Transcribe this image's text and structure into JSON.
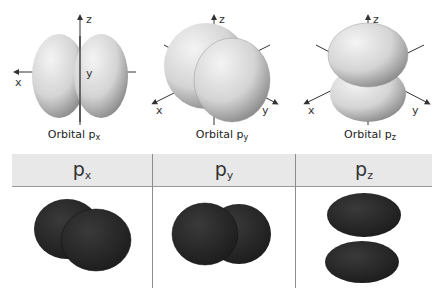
{
  "orbitals": [
    {
      "name": "Orbital p",
      "sub": "x",
      "axes": {
        "z": "z",
        "x": "x",
        "y": "y"
      }
    },
    {
      "name": "Orbital p",
      "sub": "y",
      "axes": {
        "z": "z",
        "x": "x",
        "y": "y"
      }
    },
    {
      "name": "Orbital p",
      "sub": "z",
      "axes": {
        "z": "z",
        "x": "x",
        "y": "y"
      }
    }
  ],
  "table": {
    "headers": [
      {
        "main": "p",
        "sub": "x"
      },
      {
        "main": "p",
        "sub": "y"
      },
      {
        "main": "p",
        "sub": "z"
      }
    ]
  },
  "colors": {
    "light_lobe": "#d6d6d6",
    "dark_lobe": "#2a2a2a",
    "header_bg": "#e8e8e8",
    "divider": "#8c8c8c"
  }
}
